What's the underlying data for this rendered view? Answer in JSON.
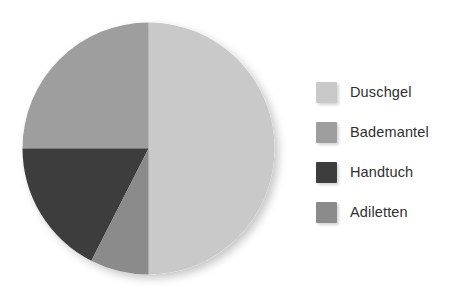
{
  "chart_data": {
    "type": "pie",
    "title": "",
    "subtitle": "",
    "xlabel": "",
    "ylabel": "",
    "categories": [
      "Duschgel",
      "Bademantel",
      "Handtuch",
      "Adiletten"
    ],
    "values": [
      50,
      25,
      17.5,
      7.5
    ],
    "value_unit": "percent",
    "colors": [
      "#c9c9c9",
      "#9e9e9e",
      "#3d3d3d",
      "#8b8b8b"
    ],
    "start_angle_deg": 0,
    "direction": "clockwise",
    "slices": [
      {
        "label": "Duschgel",
        "value": 50,
        "color": "#c9c9c9",
        "start_deg": 0,
        "end_deg": 180
      },
      {
        "label": "Bademantel",
        "value": 25,
        "color": "#9e9e9e",
        "start_deg": 270,
        "end_deg": 360
      },
      {
        "label": "Handtuch",
        "value": 17.5,
        "color": "#3d3d3d",
        "start_deg": 207,
        "end_deg": 270
      },
      {
        "label": "Adiletten",
        "value": 7.5,
        "color": "#8b8b8b",
        "start_deg": 180,
        "end_deg": 207
      }
    ],
    "legend": {
      "position": "right",
      "entries": [
        {
          "label": "Duschgel",
          "color": "#c9c9c9"
        },
        {
          "label": "Bademantel",
          "color": "#9e9e9e"
        },
        {
          "label": "Handtuch",
          "color": "#3d3d3d"
        },
        {
          "label": "Adiletten",
          "color": "#8b8b8b"
        }
      ]
    },
    "grid": false,
    "data_labels_shown": false
  }
}
